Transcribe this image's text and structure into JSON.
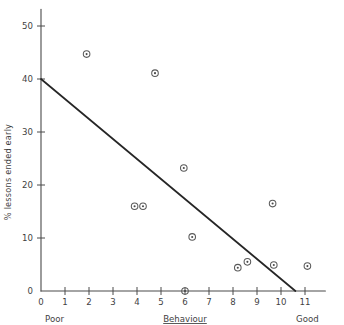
{
  "chart_data": {
    "type": "scatter",
    "title": "",
    "xlabel": "Behaviour",
    "ylabel": "% lessons ended early",
    "xlim": [
      0,
      11.6
    ],
    "ylim": [
      0,
      52
    ],
    "grid": false,
    "legend": false,
    "x_ticks": [
      "0",
      "1",
      "2",
      "3",
      "4",
      "5",
      "6",
      "7",
      "8",
      "9",
      "10",
      "11"
    ],
    "x_tick_values": [
      0,
      1,
      2,
      3,
      4,
      5,
      6,
      7,
      8,
      9,
      10,
      11
    ],
    "y_ticks": [
      "0",
      "10",
      "20",
      "30",
      "40",
      "50"
    ],
    "y_tick_values": [
      0,
      10,
      20,
      30,
      40,
      50
    ],
    "x_axis_anchors": {
      "low": "Poor",
      "high": "Good"
    },
    "marker_style": "circle-with-center-dot",
    "marker_color": "#5a5a5a",
    "line_color": "#262626",
    "points": [
      {
        "x": 1.9,
        "y": 44.7
      },
      {
        "x": 4.75,
        "y": 41.1
      },
      {
        "x": 5.95,
        "y": 23.2
      },
      {
        "x": 9.65,
        "y": 16.5
      },
      {
        "x": 3.9,
        "y": 16.0
      },
      {
        "x": 4.25,
        "y": 16.0
      },
      {
        "x": 6.3,
        "y": 10.2
      },
      {
        "x": 8.6,
        "y": 5.5
      },
      {
        "x": 9.7,
        "y": 4.9
      },
      {
        "x": 11.1,
        "y": 4.7
      },
      {
        "x": 8.2,
        "y": 4.4
      },
      {
        "x": 6.0,
        "y": 0.0
      }
    ],
    "trend_line": {
      "type": "linear-fit",
      "x_start": 0,
      "y_start": 40,
      "x_end": 10.6,
      "y_end": 0
    }
  }
}
